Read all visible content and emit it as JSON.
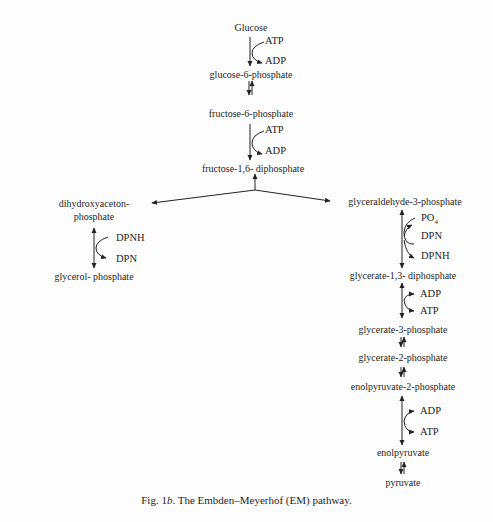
{
  "figure": {
    "caption_prefix": "Fig. 1",
    "caption_letter": "b",
    "caption_text": ". The Embden–Meyerhof (EM) pathway.",
    "main_chain": {
      "glucose": "Glucose",
      "g6p": "glucose-6-phosphate",
      "f6p": "fructose-6-phosphate",
      "fdp": "fructose-1,6- diphosphate"
    },
    "left_branch": {
      "dhap_line1": "dihydroxyaceton-",
      "dhap_line2": "phosphate",
      "glycerol_p": "glycerol- phosphate"
    },
    "right_branch": {
      "gap": "glyceraldehyde-3-phosphate",
      "g13dp": "glycerate-1,3- diphosphate",
      "g3p": "glycerate-3-phosphate",
      "g2p": "glycerate-2-phosphate",
      "pep": "enolpyruvate-2-phosphate",
      "enolpyruvate": "enolpyruvate",
      "pyruvate": "pyruvate"
    },
    "cofactors": {
      "step1_in": "ATP",
      "step1_out": "ADP",
      "step3_in": "ATP",
      "step3_out": "ADP",
      "left_in": "DPNH",
      "left_out": "DPN",
      "gap_po4": "PO",
      "gap_po4_sub": "4",
      "gap_in": "DPN",
      "gap_out": "DPNH",
      "g13_in": "ADP",
      "g13_out": "ATP",
      "pep_in": "ADP",
      "pep_out": "ATP"
    }
  }
}
